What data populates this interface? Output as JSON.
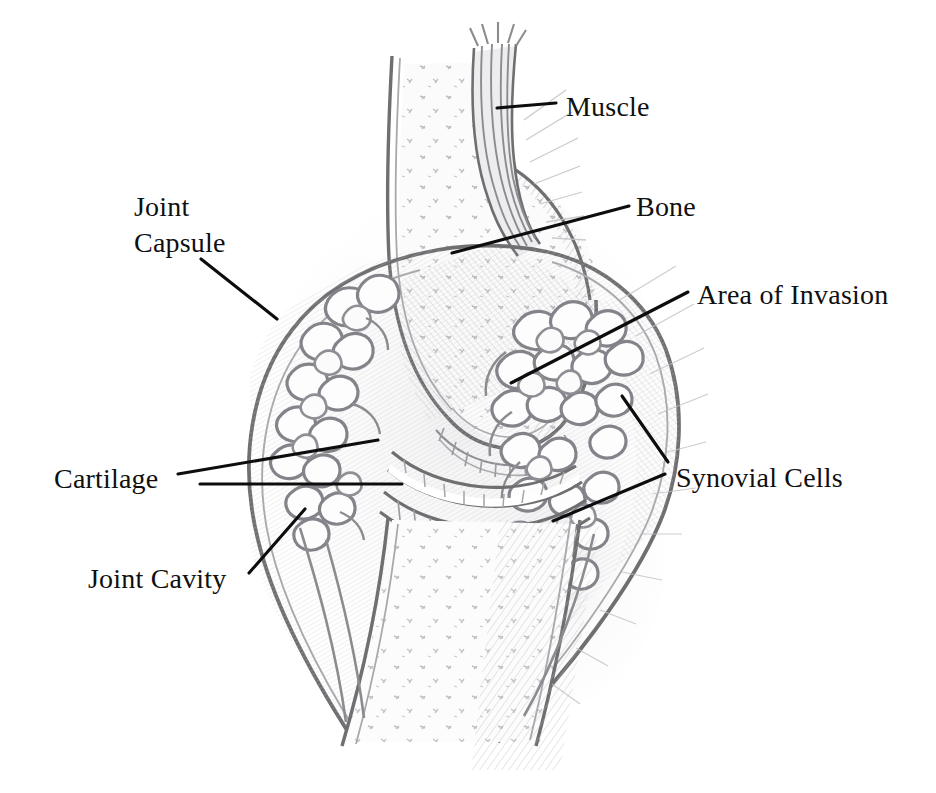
{
  "figure": {
    "kind": "anatomical-illustration",
    "background_color": "#ffffff",
    "ink_color": "#8c8c90",
    "label_color": "#101010",
    "width": 936,
    "height": 793
  },
  "labels": [
    {
      "id": "muscle",
      "text": "Muscle",
      "x": 566,
      "y": 116,
      "anchor": "start",
      "lines": [
        [
          497,
          108,
          556,
          103
        ]
      ]
    },
    {
      "id": "bone",
      "text": "Bone",
      "x": 636,
      "y": 216,
      "anchor": "start",
      "lines": [
        [
          452,
          253,
          629,
          206
        ]
      ]
    },
    {
      "id": "area-of-invasion",
      "text": "Area of Invasion",
      "x": 697,
      "y": 304,
      "anchor": "start",
      "lines": [
        [
          511,
          383,
          688,
          292
        ]
      ]
    },
    {
      "id": "joint-capsule",
      "line1": "Joint",
      "line2": "Capsule",
      "x": 134,
      "y": 216,
      "y2": 252,
      "anchor": "start",
      "lines": [
        [
          201,
          259,
          277,
          319
        ]
      ]
    },
    {
      "id": "synovial-cells",
      "text": "Synovial Cells",
      "x": 676,
      "y": 487,
      "anchor": "start",
      "lines": [
        [
          622,
          396,
          668,
          462
        ],
        [
          553,
          521,
          665,
          474
        ]
      ]
    },
    {
      "id": "cartilage",
      "text": "Cartilage",
      "x": 54,
      "y": 488,
      "anchor": "start",
      "lines": [
        [
          178,
          474,
          378,
          440
        ],
        [
          200,
          484,
          402,
          484
        ]
      ]
    },
    {
      "id": "joint-cavity",
      "text": "Joint Cavity",
      "x": 88,
      "y": 588,
      "anchor": "start",
      "lines": [
        [
          249,
          573,
          305,
          509
        ]
      ]
    }
  ]
}
